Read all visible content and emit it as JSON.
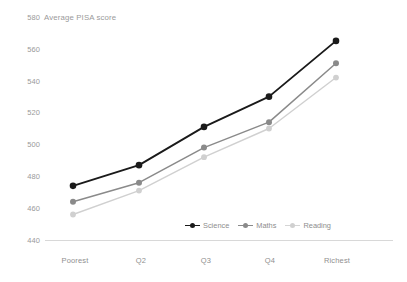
{
  "chart_data": {
    "type": "line",
    "title": "Average PISA score",
    "xlabel": "",
    "ylabel": "",
    "categories": [
      "Poorest",
      "Q2",
      "Q3",
      "Q4",
      "Richest"
    ],
    "series": [
      {
        "name": "Science",
        "color": "#1a1a1a",
        "values": [
          474,
          487,
          511,
          530,
          565
        ]
      },
      {
        "name": "Maths",
        "color": "#8a8a8a",
        "values": [
          464,
          476,
          498,
          514,
          551
        ]
      },
      {
        "name": "Reading",
        "color": "#d0d0d0",
        "values": [
          456,
          471,
          492,
          510,
          542
        ]
      }
    ],
    "ylim": [
      440,
      580
    ],
    "yticks": [
      440,
      460,
      480,
      500,
      520,
      540,
      560,
      580
    ],
    "ytick_labels": [
      "440",
      "460",
      "480",
      "500",
      "520",
      "540",
      "560",
      "580"
    ],
    "grid": false,
    "legend_position": "bottom-center"
  },
  "axis": {
    "y": {
      "t580": "580",
      "t560": "560",
      "t540": "540",
      "t520": "520",
      "t500": "500",
      "t480": "480",
      "t460": "460",
      "t440": "440"
    },
    "x": {
      "c0": "Poorest",
      "c1": "Q2",
      "c2": "Q3",
      "c3": "Q4",
      "c4": "Richest"
    }
  },
  "legend": {
    "items": [
      {
        "label": "Science"
      },
      {
        "label": "Maths"
      },
      {
        "label": "Reading"
      }
    ]
  },
  "colors": {
    "science": "#1a1a1a",
    "maths": "#8a8a8a",
    "reading": "#d0d0d0",
    "axis_text": "#9a9a9a",
    "baseline": "#d8d8d8",
    "background": "#ffffff"
  }
}
